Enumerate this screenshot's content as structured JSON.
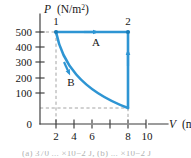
{
  "figure": {
    "name": "pv-diagram",
    "kind": "pressure-volume-cycle"
  },
  "axes": {
    "y": {
      "symbol": "P",
      "unit_main": "(N/m",
      "unit_sup": "2",
      "unit_tail": ")",
      "label_full": "P (N/m2)",
      "ticks": [
        "500",
        "400",
        "300",
        "200",
        "100",
        "0"
      ],
      "tick_values": [
        500,
        400,
        300,
        200,
        100,
        0
      ],
      "range": [
        0,
        540
      ]
    },
    "x": {
      "symbol": "V",
      "unit_main": "(m",
      "unit_sup": "3",
      "unit_tail": ")",
      "label_full": "V (m3)",
      "ticks": [
        "2",
        "4",
        "6",
        "8",
        "10"
      ],
      "tick_values": [
        2,
        4,
        6,
        8,
        10
      ],
      "range": [
        0,
        11.6
      ]
    }
  },
  "points": [
    {
      "label": "1",
      "v": 2,
      "p": 450
    },
    {
      "label": "2",
      "v": 8,
      "p": 450
    }
  ],
  "paths": [
    {
      "label": "A",
      "type": "isobaric",
      "from": "1",
      "to": "2",
      "direction": "right"
    },
    {
      "label": "B",
      "type": "curved-expansion",
      "from": "1",
      "to": "bottom-right",
      "direction": "down"
    },
    {
      "label": "",
      "type": "isochoric-return",
      "from": "bottom-right",
      "to": "2",
      "direction": "up"
    }
  ],
  "guides": [
    {
      "name": "dashed-p-450",
      "orientation": "horizontal",
      "value": 450
    },
    {
      "name": "dashed-p-100",
      "orientation": "horizontal",
      "value": 100
    },
    {
      "name": "dashed-v-2",
      "orientation": "vertical",
      "value": 2
    },
    {
      "name": "dashed-v-8",
      "orientation": "vertical",
      "value": 8
    }
  ],
  "colors": {
    "curve": "#2e95d3",
    "curve_dark": "#1a7db8",
    "axis": "#3a3a3a",
    "guide": "#9a9a9a",
    "text": "#161616",
    "background": "#ffffff"
  },
  "clipped_caption": "(a) 370 ... ×10−2 J, (b) ... ×10−2 J"
}
